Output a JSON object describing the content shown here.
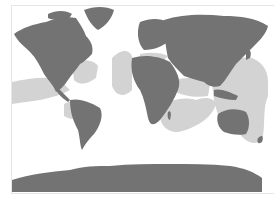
{
  "map": {
    "title": "World distribution map",
    "projection": "Equirectangular-like world map",
    "colors": {
      "background": "#ffffff",
      "land": "#737373",
      "range": "#d3d3d3",
      "frame": "#e6e6e6"
    },
    "legend": {
      "land_label": "Land",
      "range_label": "Shaded range"
    },
    "regions": [
      {
        "name": "North America"
      },
      {
        "name": "Greenland"
      },
      {
        "name": "South America"
      },
      {
        "name": "Europe"
      },
      {
        "name": "Africa"
      },
      {
        "name": "Asia"
      },
      {
        "name": "Australia"
      },
      {
        "name": "Antarctica"
      },
      {
        "name": "New Zealand"
      },
      {
        "name": "Madagascar"
      }
    ]
  }
}
